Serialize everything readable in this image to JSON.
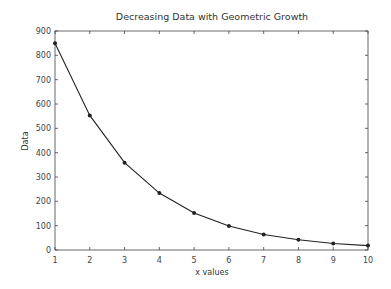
{
  "chart_data": {
    "type": "line",
    "title": "Decreasing Data with Geometric Growth",
    "xlabel": "x values",
    "ylabel": "Data",
    "x": [
      1,
      2,
      3,
      4,
      5,
      6,
      7,
      8,
      9,
      10
    ],
    "series": [
      {
        "name": "Data",
        "values": [
          850,
          553,
          359,
          234,
          152,
          99,
          64,
          42,
          27,
          18
        ],
        "color": "#222222",
        "marker": "circle"
      }
    ],
    "xlim": [
      1,
      10
    ],
    "ylim": [
      0,
      900
    ],
    "xticks": [
      1,
      2,
      3,
      4,
      5,
      6,
      7,
      8,
      9,
      10
    ],
    "yticks": [
      0,
      100,
      200,
      300,
      400,
      500,
      600,
      700,
      800,
      900
    ],
    "grid": false,
    "legend": null
  }
}
